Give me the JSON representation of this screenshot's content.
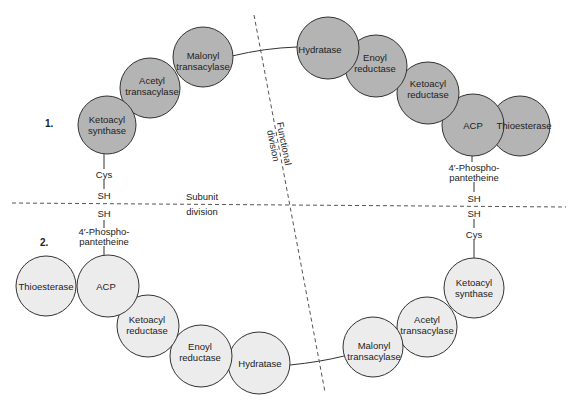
{
  "colors": {
    "subunit1_fill": "#b4b4b4",
    "subunit2_fill": "#ececec",
    "outline": "#333333",
    "background": "#ffffff"
  },
  "subunit1": {
    "label": "1.",
    "enzymes": [
      {
        "name": "Ketoacyl synthase",
        "line1": "Ketoacyl",
        "line2": "synthase"
      },
      {
        "name": "Acetyl transacylase",
        "line1": "Acetyl",
        "line2": "transacylase"
      },
      {
        "name": "Malonyl transacylase",
        "line1": "Malonyl",
        "line2": "transacylase"
      },
      {
        "name": "Hydratase",
        "line1": "Hydratase",
        "line2": ""
      },
      {
        "name": "Enoyl reductase",
        "line1": "Enoyl",
        "line2": "reductase"
      },
      {
        "name": "Ketoacyl reductase",
        "line1": "Ketoacyl",
        "line2": "reductase"
      },
      {
        "name": "ACP",
        "line1": "ACP",
        "line2": ""
      },
      {
        "name": "Thioesterase",
        "line1": "Thioesterase",
        "line2": ""
      }
    ],
    "left_chain": [
      "Cys",
      "SH"
    ],
    "right_chain": [
      "4′-Phospho-",
      "pantetheine",
      "SH"
    ]
  },
  "subunit2": {
    "label": "2.",
    "enzymes": [
      {
        "name": "Thioesterase",
        "line1": "Thioesterase",
        "line2": ""
      },
      {
        "name": "ACP",
        "line1": "ACP",
        "line2": ""
      },
      {
        "name": "Ketoacyl reductase",
        "line1": "Ketoacyl",
        "line2": "reductase"
      },
      {
        "name": "Enoyl reductase",
        "line1": "Enoyl",
        "line2": "reductase"
      },
      {
        "name": "Hydratase",
        "line1": "Hydratase",
        "line2": ""
      },
      {
        "name": "Malonyl transacylase",
        "line1": "Malonyl",
        "line2": "transacylase"
      },
      {
        "name": "Acetyl transacylase",
        "line1": "Acetyl",
        "line2": "transacylase"
      },
      {
        "name": "Ketoacyl synthase",
        "line1": "Ketoacyl",
        "line2": "synthase"
      }
    ],
    "left_chain": [
      "SH",
      "4′-Phospho-",
      "pantetheine"
    ],
    "right_chain": [
      "SH",
      "Cys"
    ]
  },
  "divisions": {
    "subunit": {
      "line1": "Subunit",
      "line2": "division"
    },
    "functional": {
      "line1": "Functional",
      "line2": "division"
    }
  }
}
